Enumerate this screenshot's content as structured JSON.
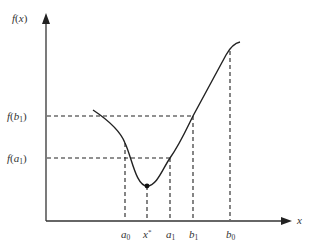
{
  "diagram": {
    "title": "",
    "y_axis_label": {
      "base": "f",
      "arg": "x"
    },
    "x_axis_label": "x",
    "y_levels": [
      {
        "id": "f_b1",
        "func": "f",
        "var": "b",
        "sub": "1"
      },
      {
        "id": "f_a1",
        "func": "f",
        "var": "a",
        "sub": "1"
      }
    ],
    "x_ticks": [
      {
        "id": "a0",
        "var": "a",
        "sub": "0",
        "sup": ""
      },
      {
        "id": "xstar",
        "var": "x",
        "sub": "",
        "sup": "*"
      },
      {
        "id": "a1",
        "var": "a",
        "sub": "1",
        "sup": ""
      },
      {
        "id": "b1",
        "var": "b",
        "sub": "1",
        "sup": ""
      },
      {
        "id": "b0",
        "var": "b",
        "sub": "0",
        "sup": ""
      }
    ],
    "minimum_point_label": "x*",
    "colors": {
      "ink": "#222222",
      "axis": "#333333",
      "background": "#ffffff"
    }
  }
}
